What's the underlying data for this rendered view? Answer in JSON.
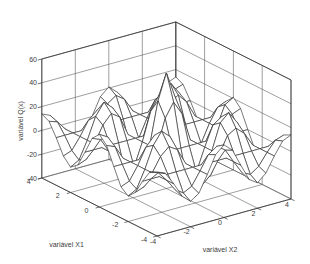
{
  "figure": {
    "background": "#ffffff"
  },
  "chart_data": {
    "type": "surface",
    "title": "",
    "x1_axis": {
      "label": "variável X1",
      "ticks": [
        "4",
        "2",
        "0",
        "-2",
        "-4"
      ],
      "range": [
        -4,
        4
      ]
    },
    "x2_axis": {
      "label": "variável X2",
      "ticks": [
        "-4",
        "-2",
        "0",
        "2",
        "4"
      ],
      "range": [
        -4,
        4
      ]
    },
    "z_axis": {
      "label": "variável Q(x)",
      "ticks": [
        "60",
        "40",
        "20",
        "0",
        "-20",
        "-40"
      ],
      "range": [
        -40,
        60
      ]
    },
    "surface": {
      "formula": "Q(x1,x2) = 57 * cos(pi*x1/2) * cos(pi*x2/2) * exp(-sqrt(x1^2+x2^2)/4)",
      "amplitude": 57,
      "angular_frequency": 1.5707963,
      "radial_decay": 0.25,
      "grid_min": -4,
      "grid_max": 4,
      "grid_step": 0.5,
      "peak_value": 57,
      "peak_location": [
        0,
        0
      ],
      "valley_value": -35,
      "valley_locations": [
        [
          2,
          0
        ],
        [
          -2,
          0
        ],
        [
          0,
          2
        ],
        [
          0,
          -2
        ]
      ]
    },
    "view": {
      "azimuth": -37.5,
      "elevation": 30,
      "grid": true
    },
    "style": {
      "mesh_line_color": "#303030",
      "mesh_face_color": "#ffffff",
      "wall_grid_color": "#4f4f4f",
      "axis_edge_color": "#333333",
      "text_color": "#3d3d3d"
    }
  }
}
